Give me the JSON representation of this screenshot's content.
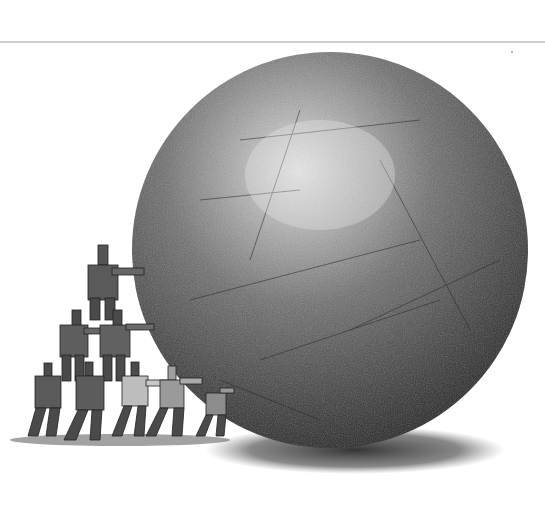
{
  "illustration": {
    "subject": "group of people forming a human pyramid pushing a giant stone ball",
    "palette": {
      "background": "#ffffff",
      "divider": "#cfcfcf",
      "ball_dark": "#2e2e2e",
      "ball_mid": "#6a6a6a",
      "ball_highlight": "#d8d8d8",
      "figure_dark": "#3a3a3a",
      "figure_mid": "#7a7a7a",
      "shadow": "#4a4a4a"
    },
    "figure_count": 8
  }
}
